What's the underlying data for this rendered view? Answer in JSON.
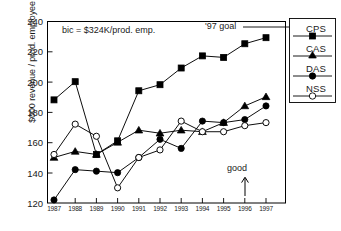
{
  "chart_data": {
    "type": "line",
    "title": "",
    "xlabel": "",
    "ylabel": "$000 revenue / prod. employee",
    "categories": [
      "1987",
      "1988",
      "1989",
      "1990",
      "1991",
      "1992",
      "1993",
      "1994",
      "1995",
      "1996",
      "1997"
    ],
    "x": [
      1987,
      1988,
      1989,
      1990,
      1991,
      1992,
      1993,
      1994,
      1995,
      1996,
      1997
    ],
    "ylim": [
      120,
      240
    ],
    "yticks": [
      120,
      140,
      160,
      180,
      200,
      220,
      240
    ],
    "xlim": [
      1987,
      1997
    ],
    "grid": false,
    "legend_position": "right-outside",
    "series": [
      {
        "name": "CPS",
        "marker": "filled-square",
        "values": [
          188,
          200,
          152,
          161,
          194,
          198,
          209,
          217,
          216,
          225,
          229
        ]
      },
      {
        "name": "CAS",
        "marker": "filled-triangle",
        "values": [
          150,
          154,
          152,
          160,
          168,
          166,
          168,
          167,
          173,
          184,
          190
        ]
      },
      {
        "name": "DAS",
        "marker": "filled-circle",
        "values": [
          122,
          142,
          141,
          140,
          150,
          162,
          156,
          174,
          173,
          175,
          184
        ]
      },
      {
        "name": "NSS",
        "marker": "open-circle",
        "values": [
          152,
          172,
          164,
          130,
          150,
          155,
          174,
          167,
          167,
          171,
          173
        ]
      }
    ],
    "annotations": [
      {
        "text": "bic = $324K/prod. emp.",
        "kind": "text"
      },
      {
        "text": "'97 goal",
        "kind": "callout-to-legend"
      },
      {
        "text": "good",
        "kind": "arrow-up",
        "at_category": "1996"
      }
    ],
    "colors": {
      "line": "#000000",
      "axis": "#000000",
      "background": "#ffffff"
    }
  },
  "ylabel_text": "$000 revenue / prod. employee",
  "ytick_labels": [
    "240",
    "220",
    "200",
    "180",
    "160",
    "140",
    "120"
  ],
  "xtick_labels": [
    "1987",
    "1988",
    "1989",
    "1990",
    "1991",
    "1992",
    "1993",
    "1994",
    "1995",
    "1996",
    "1997"
  ],
  "annotations": {
    "bic": "bic = $324K/prod. emp.",
    "goal": "'97 goal",
    "good": "good"
  },
  "legend": {
    "items": [
      {
        "label": "CPS",
        "marker": "filled-square"
      },
      {
        "label": "CAS",
        "marker": "filled-triangle"
      },
      {
        "label": "DAS",
        "marker": "filled-circle"
      },
      {
        "label": "NSS",
        "marker": "open-circle"
      }
    ]
  }
}
